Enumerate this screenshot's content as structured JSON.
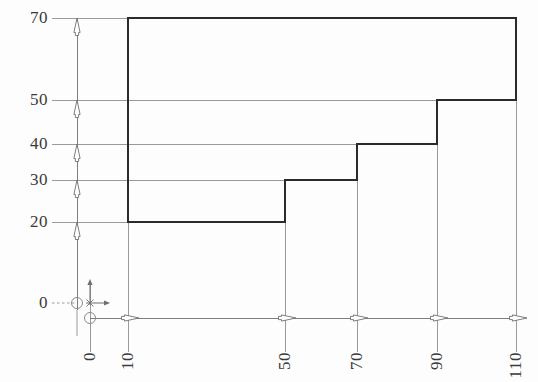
{
  "document": {
    "title": "Stepped Profile Dimensioned Drawing",
    "type": "technical-drawing",
    "background_color": "#fdfdfd",
    "profile_stroke_color": "#2b2b2b",
    "gridline_color": "#9a9a9a",
    "axis_color": "#8d8d8d",
    "text_color": "#3a3a3a"
  },
  "chart_data": {
    "type": "line",
    "xlabel": "",
    "ylabel": "",
    "xlim": [
      0,
      120
    ],
    "ylim": [
      0,
      76
    ],
    "grid": true,
    "legend": false,
    "x_ticks": [
      0,
      10,
      50,
      70,
      90,
      110
    ],
    "x_tick_labels": [
      "0",
      "10",
      "50",
      "70",
      "90",
      "110"
    ],
    "y_ticks": [
      0,
      20,
      30,
      40,
      50,
      70
    ],
    "y_tick_labels": [
      "0",
      "20",
      "30",
      "40",
      "50",
      "70"
    ],
    "series": [
      {
        "name": "profile-outline",
        "closed": true,
        "points": [
          [
            10,
            70
          ],
          [
            110,
            70
          ],
          [
            110,
            50
          ],
          [
            90,
            50
          ],
          [
            90,
            40
          ],
          [
            70,
            40
          ],
          [
            70,
            30
          ],
          [
            50,
            30
          ],
          [
            50,
            20
          ],
          [
            10,
            20
          ]
        ]
      }
    ],
    "annotations": [
      {
        "name": "origin-marker",
        "x": 0,
        "y": 0,
        "label": "0"
      },
      {
        "name": "y-dimension-arrow-20",
        "value": 20
      },
      {
        "name": "y-dimension-arrow-30",
        "value": 30
      },
      {
        "name": "y-dimension-arrow-40",
        "value": 40
      },
      {
        "name": "y-dimension-arrow-50",
        "value": 50
      },
      {
        "name": "y-dimension-arrow-70",
        "value": 70
      },
      {
        "name": "x-dimension-arrow-10",
        "value": 10
      },
      {
        "name": "x-dimension-arrow-50",
        "value": 50
      },
      {
        "name": "x-dimension-arrow-70",
        "value": 70
      },
      {
        "name": "x-dimension-arrow-90",
        "value": 90
      },
      {
        "name": "x-dimension-arrow-110",
        "value": 110
      }
    ]
  },
  "axes": {
    "y": {
      "labels": [
        {
          "text": "70",
          "px": 18
        },
        {
          "text": "50",
          "px": 100
        },
        {
          "text": "40",
          "px": 144
        },
        {
          "text": "30",
          "px": 180
        },
        {
          "text": "20",
          "px": 222
        },
        {
          "text": "0",
          "px": 303
        }
      ]
    },
    "x": {
      "labels": [
        {
          "text": "0",
          "px": 90
        },
        {
          "text": "10",
          "px": 128
        },
        {
          "text": "50",
          "px": 285
        },
        {
          "text": "70",
          "px": 357
        },
        {
          "text": "90",
          "px": 437
        },
        {
          "text": "110",
          "px": 516
        }
      ]
    }
  }
}
